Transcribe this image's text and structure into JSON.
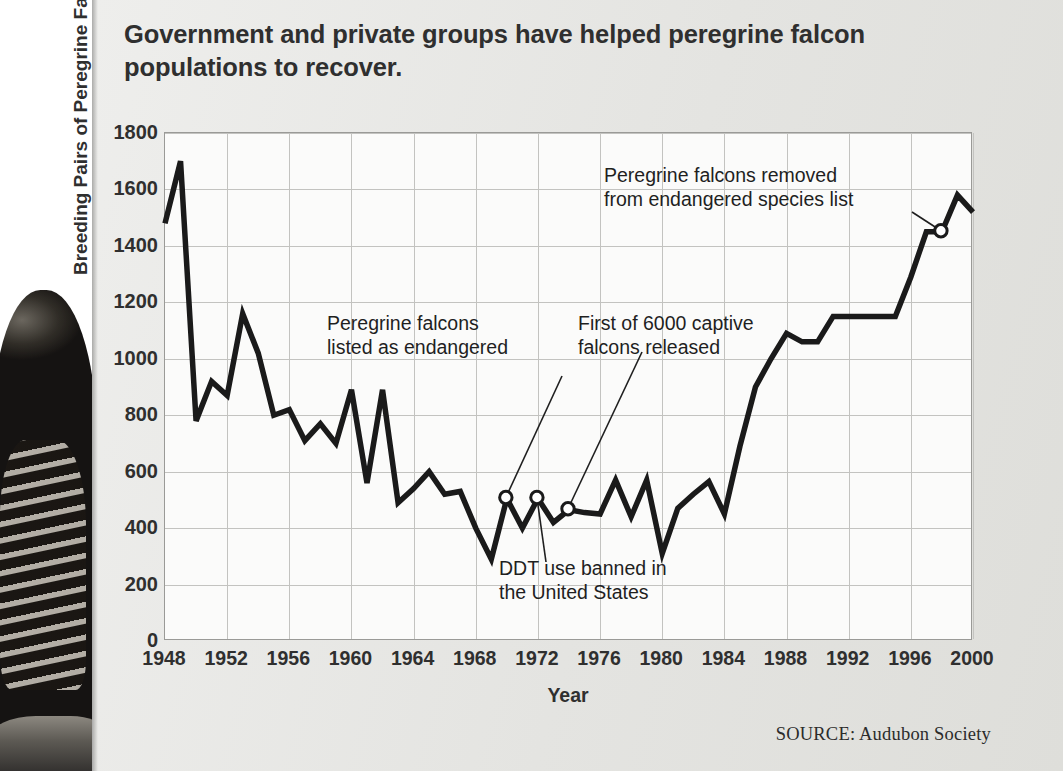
{
  "headline": "Government and private groups have helped peregrine falcon populations to recover.",
  "source": "SOURCE: Audubon Society",
  "annotations": {
    "listed": "Peregrine falcons\nlisted as endangered",
    "captive": "First of 6000 captive\nfalcons released",
    "removed": "Peregrine falcons removed\nfrom endangered species list",
    "ddt": "DDT use banned in\nthe United States"
  },
  "colors": {
    "line": "#1a1a1a",
    "plot_background": "#fbfbfa",
    "grid": "#c3c3c0",
    "axis": "#9a9a97",
    "text": "#2f2f2f",
    "page_background": "#e7e7e4"
  },
  "chart_data": {
    "type": "line",
    "title": "Government and private groups have helped peregrine falcon populations to recover.",
    "xlabel": "Year",
    "ylabel": "Breeding Pairs of Peregrine Falcons",
    "xlim": [
      1948,
      2000
    ],
    "ylim": [
      0,
      1800
    ],
    "ytick_labels": [
      "0",
      "200",
      "400",
      "600",
      "800",
      "1000",
      "1200",
      "1400",
      "1600",
      "1800"
    ],
    "yticks": [
      0,
      200,
      400,
      600,
      800,
      1000,
      1200,
      1400,
      1600,
      1800
    ],
    "xtick_labels": [
      "1948",
      "1952",
      "1956",
      "1960",
      "1964",
      "1968",
      "1972",
      "1976",
      "1980",
      "1984",
      "1988",
      "1992",
      "1996",
      "2000"
    ],
    "xticks": [
      1948,
      1952,
      1956,
      1960,
      1964,
      1968,
      1972,
      1976,
      1980,
      1984,
      1988,
      1992,
      1996,
      2000
    ],
    "grid": true,
    "legend": "none",
    "series": [
      {
        "name": "Breeding Pairs of Peregrine Falcons",
        "x": [
          1948,
          1949,
          1950,
          1951,
          1952,
          1953,
          1954,
          1955,
          1956,
          1957,
          1958,
          1959,
          1960,
          1961,
          1962,
          1963,
          1964,
          1965,
          1966,
          1967,
          1968,
          1969,
          1970,
          1971,
          1972,
          1973,
          1974,
          1975,
          1976,
          1977,
          1978,
          1979,
          1980,
          1981,
          1982,
          1983,
          1984,
          1985,
          1986,
          1987,
          1988,
          1989,
          1990,
          1991,
          1992,
          1993,
          1994,
          1995,
          1996,
          1997,
          1998,
          1999,
          2000
        ],
        "values": [
          1480,
          1700,
          780,
          920,
          870,
          1160,
          1020,
          800,
          820,
          710,
          770,
          700,
          890,
          560,
          890,
          490,
          540,
          600,
          520,
          530,
          400,
          290,
          505,
          400,
          505,
          420,
          465,
          455,
          450,
          570,
          440,
          570,
          310,
          470,
          520,
          565,
          450,
          690,
          900,
          1000,
          1090,
          1060,
          1060,
          1150,
          1150,
          1150,
          1150,
          1150,
          1290,
          1450,
          1450,
          1580,
          1520
        ]
      }
    ],
    "markers": [
      {
        "x": 1970,
        "y": 505,
        "label": "Peregrine falcons listed as endangered"
      },
      {
        "x": 1972,
        "y": 505,
        "label": "DDT use banned in the United States"
      },
      {
        "x": 1974,
        "y": 465,
        "label": "First of 6000 captive falcons released"
      },
      {
        "x": 1998,
        "y": 1450,
        "label": "Peregrine falcons removed from endangered species list"
      }
    ],
    "annotations": [
      {
        "text": "Peregrine falcons listed as endangered",
        "points_to": [
          1970,
          505
        ]
      },
      {
        "text": "DDT use banned in the United States",
        "points_to": [
          1972,
          505
        ]
      },
      {
        "text": "First of 6000 captive falcons released",
        "points_to": [
          1974,
          465
        ]
      },
      {
        "text": "Peregrine falcons removed from endangered species list",
        "points_to": [
          1998,
          1450
        ]
      }
    ]
  }
}
